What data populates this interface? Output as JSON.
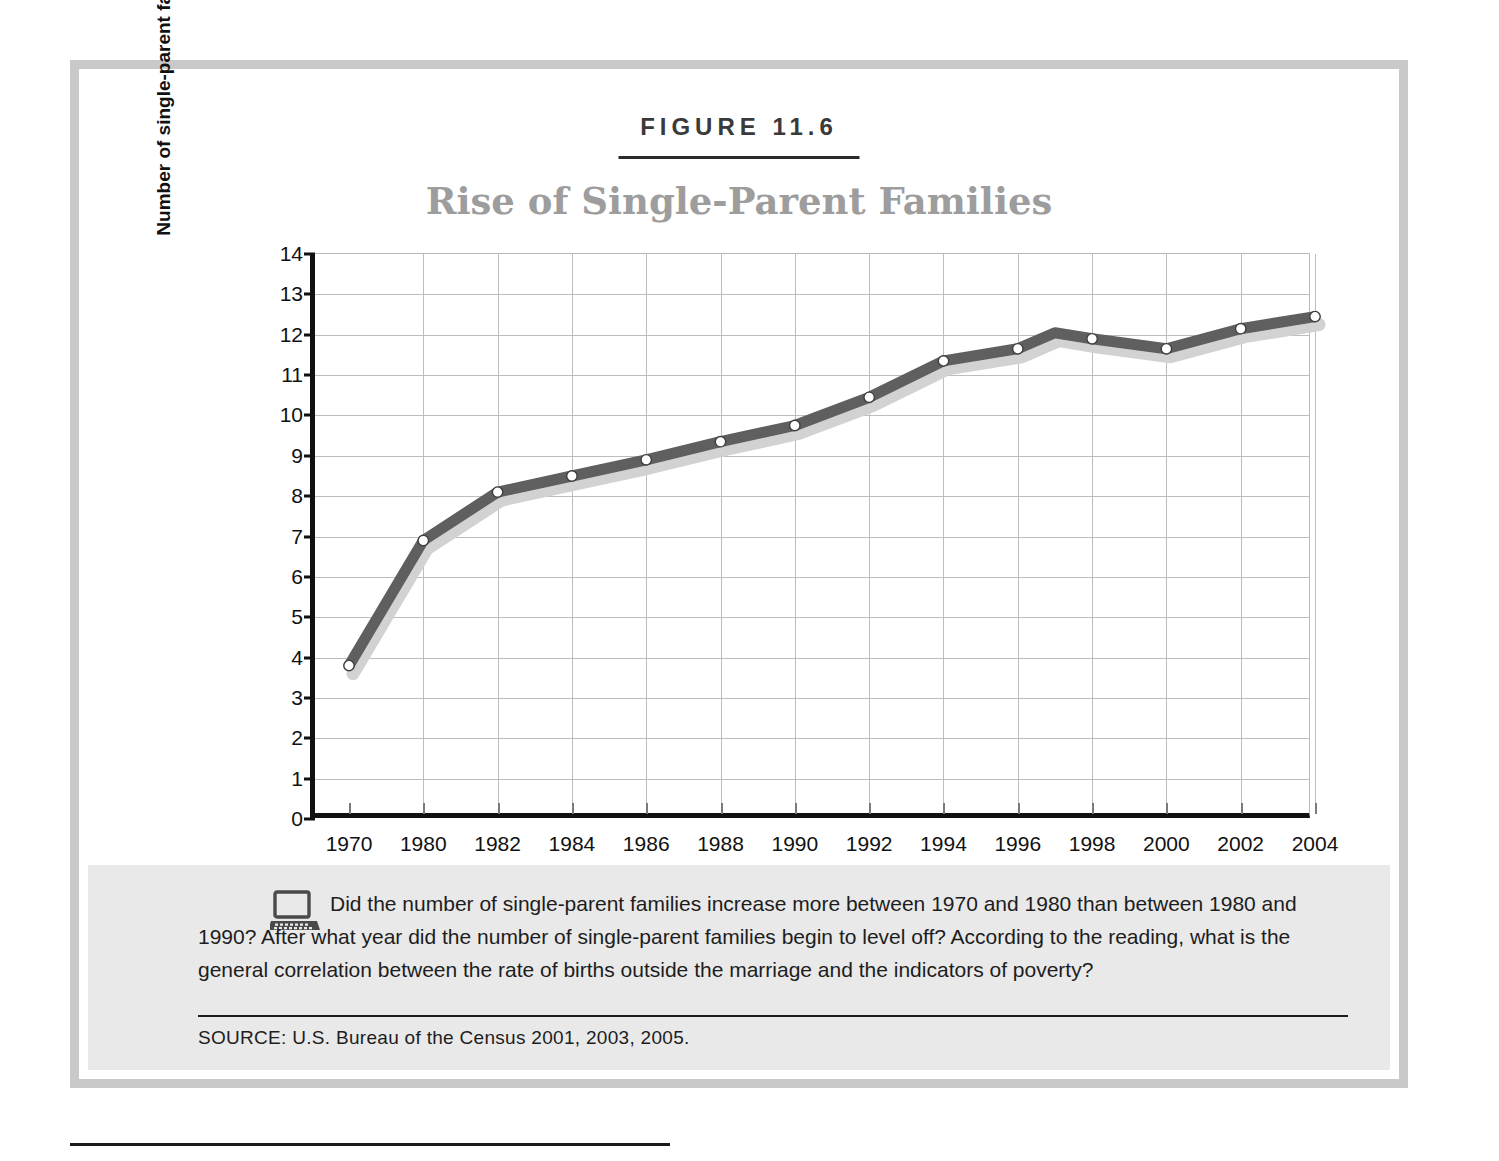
{
  "figure": {
    "label": "FIGURE 11.6",
    "title": "Rise of Single-Parent Families"
  },
  "caption": {
    "icon": "laptop-icon",
    "text": "Did the number of single-parent families increase more between 1970 and 1980 than between 1980 and 1990? After what year did the number of single-parent families begin to level off? According to the reading, what is the general correlation between the rate of births outside the marriage and the indicators of poverty?",
    "source": "SOURCE:  U.S. Bureau of the Census 2001, 2003, 2005."
  },
  "colors": {
    "frame": "#c9c9c9",
    "title": "#9d9d9d",
    "line": "#5f5f5f",
    "shadow": "#d2d2d2",
    "grid": "#bdbdbd",
    "axis": "#111111",
    "caption_bg": "#e9e9e9"
  },
  "chart_data": {
    "type": "line",
    "title": "Rise of Single-Parent Families",
    "xlabel": "",
    "ylabel": "Number of single-parent families (millions)",
    "ylim": [
      0,
      14
    ],
    "yticks": [
      0,
      1,
      2,
      3,
      4,
      5,
      6,
      7,
      8,
      9,
      10,
      11,
      12,
      13,
      14
    ],
    "grid": true,
    "legend": "none",
    "x_tick_labels": [
      "1970",
      "1980",
      "1982",
      "1984",
      "1986",
      "1988",
      "1990",
      "1992",
      "1994",
      "1996",
      "1998",
      "2000",
      "2002",
      "2004"
    ],
    "x": [
      1970,
      1980,
      1982,
      1984,
      1986,
      1988,
      1990,
      1992,
      1994,
      1996,
      1997,
      1998,
      2000,
      2002,
      2004
    ],
    "values": [
      3.8,
      6.9,
      8.1,
      8.5,
      8.9,
      9.35,
      9.75,
      10.45,
      11.35,
      11.65,
      12.05,
      11.9,
      11.65,
      12.15,
      12.45
    ],
    "marker_years": [
      1970,
      1980,
      1982,
      1984,
      1986,
      1988,
      1990,
      1992,
      1994,
      1996,
      1998,
      2000,
      2002,
      2004
    ],
    "series": [
      {
        "name": "Single-parent families",
        "values": [
          3.8,
          6.9,
          8.1,
          8.5,
          8.9,
          9.35,
          9.75,
          10.45,
          11.35,
          11.65,
          12.05,
          11.9,
          11.65,
          12.15,
          12.45
        ]
      }
    ]
  }
}
